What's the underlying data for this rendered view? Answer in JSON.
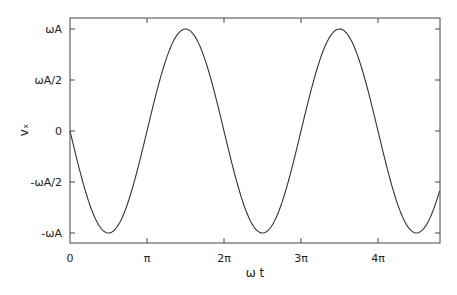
{
  "chart_data": {
    "type": "line",
    "title": "",
    "xlabel": "ω t",
    "ylabel": "vₓ",
    "function": "v = -ωA·sin(ωt)",
    "xlim_pi": [
      0,
      4.8
    ],
    "ylim": [
      -1.13,
      1.12
    ],
    "x_ticks": [
      {
        "value_pi": 0,
        "label": "0"
      },
      {
        "value_pi": 1,
        "label": "π"
      },
      {
        "value_pi": 2,
        "label": "2π"
      },
      {
        "value_pi": 3,
        "label": "3π"
      },
      {
        "value_pi": 4,
        "label": "4π"
      }
    ],
    "y_ticks": [
      {
        "value": 1,
        "label": "ωA"
      },
      {
        "value": 0.5,
        "label": "ωA/2"
      },
      {
        "value": 0,
        "label": "0"
      },
      {
        "value": -0.5,
        "label": "-ωA/2"
      },
      {
        "value": -1,
        "label": "-ωA"
      }
    ],
    "series": [
      {
        "name": "vx",
        "color": "#333333",
        "x_pi": [
          0,
          0.5,
          1,
          1.5,
          2,
          2.5,
          3,
          3.5,
          4,
          4.5,
          4.8
        ],
        "values": [
          0,
          -1,
          0,
          1,
          0,
          -1,
          0,
          1,
          0,
          -1,
          -0.59
        ]
      }
    ],
    "grid": false,
    "legend": null
  }
}
